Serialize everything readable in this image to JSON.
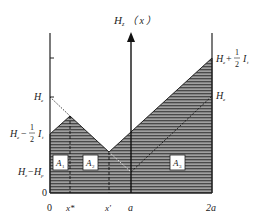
{
  "diagram": {
    "axis_label_main": "H",
    "axis_label_sub": "z",
    "axis_label_arg": "（ x ）",
    "x_ticks": [
      {
        "label": "0",
        "x": 50
      },
      {
        "label": "x*",
        "x": 70
      },
      {
        "label": "x'",
        "x": 109
      },
      {
        "label": "a",
        "x": 131
      },
      {
        "label": "2a",
        "x": 212
      }
    ],
    "y_labels_left": [
      {
        "text": "He",
        "y": 97
      },
      {
        "text": "He − ½ It",
        "y": 134
      },
      {
        "text": "He − Hp",
        "y": 172
      },
      {
        "text": "0",
        "y": 193
      }
    ],
    "y_labels_right": [
      {
        "text": "He + ½ It",
        "y": 58
      },
      {
        "text": "He",
        "y": 96
      }
    ],
    "regions": [
      {
        "label": "A",
        "sub": "1"
      },
      {
        "label": "A",
        "sub": "2"
      },
      {
        "label": "A",
        "sub": "3"
      }
    ],
    "colors": {
      "hatch_fill": "#555555",
      "hatch_line": "#dddddd",
      "line": "#111111"
    }
  }
}
